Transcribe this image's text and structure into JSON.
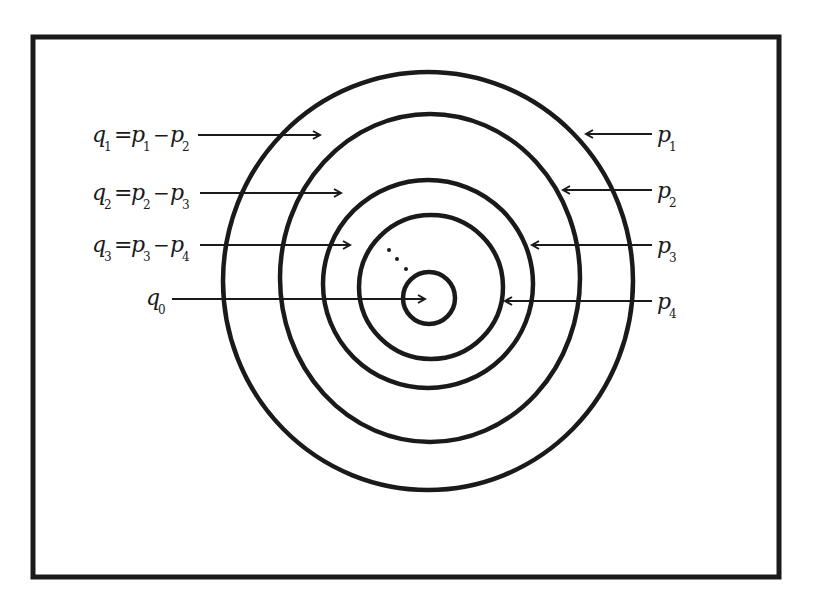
{
  "figure": {
    "colors": {
      "stroke": "#1a1a1a",
      "background": "#ffffff"
    },
    "frame": {
      "x": 33,
      "y": 37,
      "width": 746,
      "height": 540
    },
    "circles": [
      {
        "name": "circle-p1",
        "cx": 428,
        "cy": 281,
        "rx": 205,
        "ry": 209
      },
      {
        "name": "circle-p2",
        "cx": 430,
        "cy": 278,
        "rx": 150,
        "ry": 164
      },
      {
        "name": "circle-p3",
        "cx": 428,
        "cy": 284,
        "rx": 105,
        "ry": 104
      },
      {
        "name": "circle-p4",
        "cx": 431,
        "cy": 287,
        "rx": 72,
        "ry": 72
      },
      {
        "name": "circle-center",
        "cx": 429,
        "cy": 298,
        "rx": 26,
        "ry": 26
      }
    ],
    "left_labels": [
      {
        "q": "q",
        "q_sub": "1",
        "eq": "=",
        "a": "p",
        "a_sub": "1",
        "minus": "−",
        "b": "p",
        "b_sub": "2",
        "y": 143,
        "arrow": {
          "x1": 198,
          "x2": 320,
          "y": 135
        }
      },
      {
        "q": "q",
        "q_sub": "2",
        "eq": "=",
        "a": "p",
        "a_sub": "2",
        "minus": "−",
        "b": "p",
        "b_sub": "3",
        "y": 200,
        "arrow": {
          "x1": 200,
          "x2": 341,
          "y": 193
        }
      },
      {
        "q": "q",
        "q_sub": "3",
        "eq": "=",
        "a": "p",
        "a_sub": "3",
        "minus": "−",
        "b": "p",
        "b_sub": "4",
        "y": 252,
        "arrow": {
          "x1": 200,
          "x2": 350,
          "y": 245
        }
      }
    ],
    "q0_label": {
      "q": "q",
      "q_sub": "0",
      "arrow": {
        "x1": 172,
        "x2": 425,
        "y": 299
      }
    },
    "right_labels": [
      {
        "p": "p",
        "p_sub": "1",
        "y": 142,
        "arrow": {
          "x1": 652,
          "x2": 586,
          "y": 134
        }
      },
      {
        "p": "p",
        "p_sub": "2",
        "y": 198,
        "arrow": {
          "x1": 652,
          "x2": 563,
          "y": 190
        }
      },
      {
        "p": "p",
        "p_sub": "3",
        "y": 253,
        "arrow": {
          "x1": 652,
          "x2": 532,
          "y": 245
        }
      },
      {
        "p": "p",
        "p_sub": "4",
        "y": 309,
        "arrow": {
          "x1": 652,
          "x2": 505,
          "y": 301
        }
      }
    ],
    "ellipsis_dots": [
      {
        "cx": 389,
        "cy": 250
      },
      {
        "cx": 397,
        "cy": 259
      },
      {
        "cx": 406,
        "cy": 269
      }
    ]
  }
}
